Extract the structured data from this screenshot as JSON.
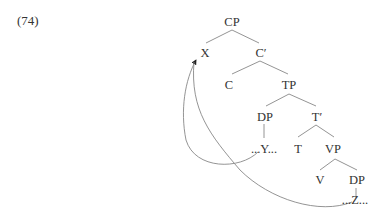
{
  "example": {
    "number": "(74)"
  },
  "tree": {
    "nodes": {
      "cp": "CP",
      "x": "X",
      "c_bar": "C′",
      "c": "C",
      "tp": "TP",
      "dp_spec": "DP",
      "t_bar": "T′",
      "y": "...Y...",
      "t": "T",
      "vp": "VP",
      "v": "V",
      "dp_obj": "DP",
      "z": "...Z..."
    },
    "movements": [
      {
        "from": "...Y...",
        "to": "X"
      },
      {
        "from": "...Z...",
        "to": "X"
      }
    ]
  }
}
